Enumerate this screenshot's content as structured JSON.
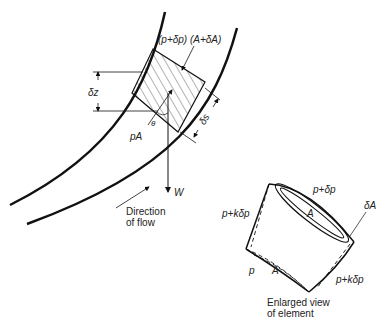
{
  "labels": {
    "force_top": "(p+δp) (A+δA)",
    "dz": "δz",
    "ds": "δs",
    "theta": "θ",
    "pA": "pA",
    "weight": "W",
    "direction_line1": "Direction",
    "direction_line2": "of flow",
    "enl_top": "p+δp",
    "enl_dA": "δA",
    "enl_A_top": "A",
    "enl_left": "p+kδp",
    "enl_right": "p+kδp",
    "enl_p": "p",
    "enl_A_bottom": "A",
    "caption_line1": "Enlarged view",
    "caption_line2": "of element"
  },
  "colors": {
    "ink": "#111111",
    "background": "#ffffff"
  }
}
